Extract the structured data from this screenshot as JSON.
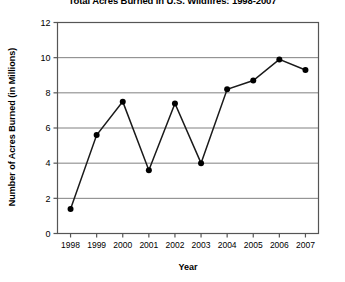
{
  "chart_data": {
    "type": "line",
    "title": "Total Acres Burned in U.S. Wildfires: 1998-2007",
    "xlabel": "Year",
    "ylabel": "Number of Acres Burned (in Millions)",
    "categories": [
      "1998",
      "1999",
      "2000",
      "2001",
      "2002",
      "2003",
      "2004",
      "2005",
      "2006",
      "2007"
    ],
    "values": [
      1.4,
      5.6,
      7.5,
      3.6,
      7.4,
      4.0,
      8.2,
      8.7,
      9.9,
      9.3
    ],
    "ylim": [
      0,
      12
    ],
    "y_ticks": [
      "0",
      "2",
      "4",
      "6",
      "8",
      "10",
      "12"
    ],
    "y_tick_values": [
      0,
      2,
      4,
      6,
      8,
      10,
      12
    ],
    "grid": "horizontal",
    "legend": "none",
    "marker": "filled-circle",
    "line_color": "#1a1a1a",
    "marker_color": "#000000",
    "grid_color": "#808080",
    "axis_color": "#555555",
    "background": "#ffffff"
  }
}
